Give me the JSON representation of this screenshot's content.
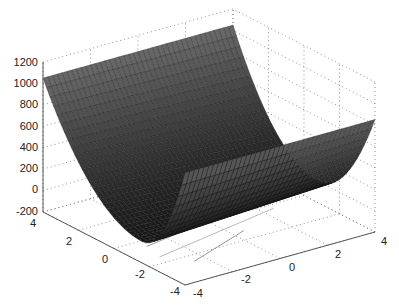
{
  "chart_data": {
    "type": "surface",
    "title": "",
    "xlabel": "",
    "ylabel": "",
    "zlabel": "",
    "x_ticks": [
      -4,
      -2,
      0,
      2,
      4
    ],
    "y_ticks": [
      -4,
      -2,
      0,
      2,
      4
    ],
    "z_ticks": [
      -200,
      0,
      200,
      400,
      600,
      800,
      1000,
      1200
    ],
    "xlim": [
      -4,
      4
    ],
    "ylim": [
      -4,
      4
    ],
    "zlim": [
      -200,
      1200
    ],
    "grid": true,
    "colormap": "gray",
    "surface_description": "Parabolic trough surface; minimum ~0 along a valley, rising to ~1050 at the left corner and ~850 along the far right edge",
    "sample_points": [
      {
        "x": -4,
        "y": 4,
        "z": 1050
      },
      {
        "x": 4,
        "y": 4,
        "z": 830
      },
      {
        "x": 0,
        "y": -3,
        "z": 0
      }
    ]
  },
  "labels": {
    "z": [
      "1200",
      "1000",
      "800",
      "600",
      "400",
      "200",
      "0",
      "-200"
    ],
    "left_axis": [
      "4",
      "2",
      "0",
      "-2",
      "-4"
    ],
    "right_axis": [
      "-4",
      "-2",
      "0",
      "2",
      "4"
    ]
  }
}
